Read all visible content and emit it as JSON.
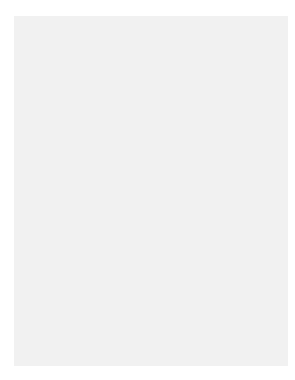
{
  "chart_data": {
    "type": "line",
    "title": "",
    "function": "y = 300 * (1/3)^x",
    "xlabel": "x",
    "ylabel": "y",
    "xlim": [
      0,
      4.5
    ],
    "ylim": [
      0,
      312.5
    ],
    "grid": true,
    "grid_x_step": 0.5,
    "grid_y_step": 25,
    "x_ticks": [
      "0",
      "1",
      "2",
      "3",
      "4"
    ],
    "y_ticks": [
      "0",
      "25",
      "50",
      "75",
      "100",
      "125",
      "150",
      "175",
      "200",
      "225",
      "250",
      "275",
      "300"
    ],
    "series": [
      {
        "name": "exponential decay",
        "x": [
          0,
          1,
          2,
          3,
          4
        ],
        "values": [
          300,
          100,
          33.333,
          11.111,
          3.704
        ]
      }
    ],
    "points": [
      {
        "x": 0,
        "y": 300,
        "label_whole": "(0, 300)",
        "label_prefix": "",
        "num": "",
        "den": "",
        "label_suffix": ""
      },
      {
        "x": 1,
        "y": 100,
        "label_whole": "(1, 100)",
        "label_prefix": "",
        "num": "",
        "den": "",
        "label_suffix": ""
      },
      {
        "x": 2,
        "y": 33.333,
        "label_whole": "",
        "label_prefix": "(2, 33",
        "num": "1",
        "den": "3",
        "label_suffix": ")"
      },
      {
        "x": 3,
        "y": 11.111,
        "label_whole": "",
        "label_prefix": "(3, 11",
        "num": "1",
        "den": "9",
        "label_suffix": ")"
      },
      {
        "x": 4,
        "y": 3.704,
        "label_whole": "",
        "label_prefix": "(4, 3",
        "num": "19",
        "den": "27",
        "label_suffix": ")"
      }
    ],
    "colors": {
      "panel_bg": "#f1f1f1",
      "plot_bg": "#ffffff",
      "grid": "#c9c9c9",
      "axis": "#1a1a1a",
      "curve": "#707070"
    }
  }
}
